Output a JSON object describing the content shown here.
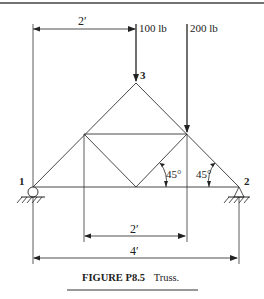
{
  "figure": {
    "caption_label": "FIGURE P8.5",
    "caption_text": "Truss.",
    "loads": [
      {
        "label": "100 lb"
      },
      {
        "label": "200 lb"
      }
    ],
    "nodes": [
      {
        "label": "1"
      },
      {
        "label": "2"
      },
      {
        "label": "3"
      }
    ],
    "angles": [
      "45°",
      "45°"
    ],
    "dimensions": {
      "top": "2′",
      "bottom_inner": "2′",
      "bottom_total": "4′"
    },
    "colors": {
      "line": "#222222",
      "background": "#ffffff"
    }
  }
}
